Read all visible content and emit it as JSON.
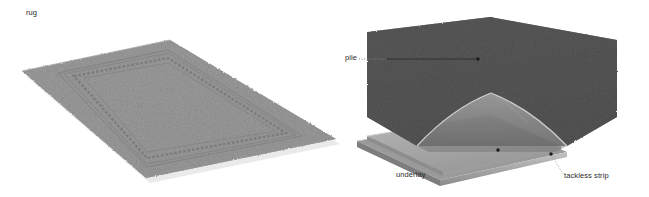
{
  "figure": {
    "caption": "rug",
    "background_color": "#ffffff"
  },
  "left_panel": {
    "name": "rug-overview-illustration",
    "description": "rug",
    "rug_face_color": "#9b9b9b",
    "rug_shadow_color": "#8d8d8d",
    "border_band_color": "#7e7e7e",
    "corners": {
      "left": [
        22,
        71
      ],
      "top": [
        170,
        40
      ],
      "right": [
        336,
        139
      ],
      "bottom": [
        146,
        178
      ]
    }
  },
  "right_panel": {
    "name": "carpet-cutaway-illustration",
    "pile_color": "#565656",
    "pile_side_color": "#4c4c4c",
    "underlay_color": "#a9a9a9",
    "underlay_edge_color": "#bdbdbd",
    "tackless_strip_color": "#8f8f8f",
    "labels": [
      {
        "id": "pile",
        "text": "pile",
        "text_pos": [
          345,
          53
        ],
        "dot": [
          478,
          59
        ]
      },
      {
        "id": "underlay",
        "text": "underlay",
        "text_pos": [
          396,
          170
        ],
        "dot": [
          498,
          150
        ]
      },
      {
        "id": "tackless-strip",
        "text": "tackless strip",
        "text_pos": [
          564,
          171
        ],
        "dot": [
          551,
          154
        ]
      }
    ]
  },
  "colors": {
    "leader_line": "#4a4a4a",
    "leader_dotted": "#8a8a8a",
    "text": "#2b2b2b"
  }
}
